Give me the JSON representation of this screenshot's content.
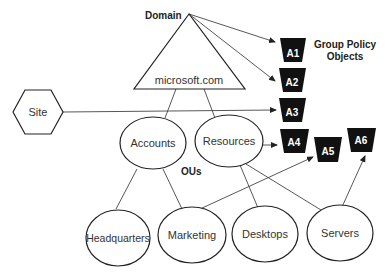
{
  "labels": {
    "domain": "Domain",
    "domain_name": "microsoft.com",
    "gpo_title_line1": "Group Policy",
    "gpo_title_line2": "Objects",
    "ous": "OUs",
    "site": "Site"
  },
  "ous": {
    "accounts": "Accounts",
    "resources": "Resources",
    "headquarters": "Headquarters",
    "marketing": "Marketing",
    "desktops": "Desktops",
    "servers": "Servers"
  },
  "gpos": [
    "A1",
    "A2",
    "A3",
    "A4",
    "A5",
    "A6"
  ],
  "colors": {
    "gpo_fill": "#111111",
    "line": "#444444",
    "background": "#ffffff"
  }
}
